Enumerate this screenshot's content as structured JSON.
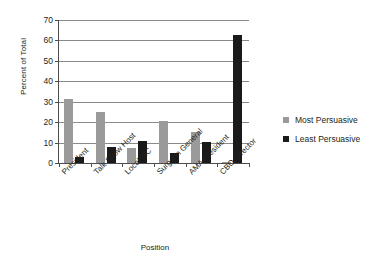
{
  "chart_data": {
    "type": "bar",
    "title": "",
    "xlabel": "Position",
    "ylabel": "Percent of Total",
    "ylim": [
      0,
      70
    ],
    "ytick_step": 10,
    "yticks": [
      0,
      10,
      20,
      30,
      40,
      50,
      60,
      70
    ],
    "grid": true,
    "legend_position": "right",
    "categories": [
      "President",
      "Talk Show Host",
      "Local MC",
      "Surgeon General",
      "AMA President",
      "CBO Director"
    ],
    "series": [
      {
        "name": "Most Persuasive",
        "color": "#9a9a9a",
        "values": [
          31.5,
          25,
          7.5,
          20.5,
          15,
          0.5
        ]
      },
      {
        "name": "Least Persuasive",
        "color": "#1a1a1a",
        "values": [
          3,
          8,
          11,
          5,
          10.5,
          62.5
        ]
      }
    ]
  },
  "colors": {
    "most_persuasive": "#9a9a9a",
    "least_persuasive": "#1a1a1a",
    "axis": "#4d4d4d",
    "gridline": "#8a8a8a",
    "background": "#ffffff",
    "text": "#231f20"
  }
}
